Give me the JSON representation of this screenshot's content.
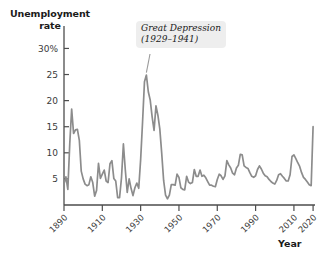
{
  "chart_data": {
    "type": "line",
    "title": "",
    "ylabel": "Unemployment rate",
    "xlabel": "Year",
    "ylim": [
      0,
      32
    ],
    "xlim": [
      1890,
      2021
    ],
    "grid": false,
    "legend": "none",
    "y_ticks": [
      {
        "value": 30,
        "label": "30%"
      },
      {
        "value": 25,
        "label": "25"
      },
      {
        "value": 20,
        "label": "20"
      },
      {
        "value": 15,
        "label": "15"
      },
      {
        "value": 10,
        "label": "10"
      },
      {
        "value": 5,
        "label": "5"
      }
    ],
    "x_ticks": [
      {
        "value": 1890,
        "label": "1890"
      },
      {
        "value": 1910,
        "label": "1910"
      },
      {
        "value": 1930,
        "label": "1930"
      },
      {
        "value": 1950,
        "label": "1950"
      },
      {
        "value": 1970,
        "label": "1970"
      },
      {
        "value": 1990,
        "label": "1990"
      },
      {
        "value": 2010,
        "label": "2010"
      },
      {
        "value": 2020,
        "label": "2020"
      }
    ],
    "series": [
      {
        "name": "Unemployment rate",
        "color": "#8c8c8c",
        "x": [
          1890,
          1891,
          1892,
          1893,
          1894,
          1895,
          1896,
          1897,
          1898,
          1899,
          1900,
          1901,
          1902,
          1903,
          1904,
          1905,
          1906,
          1907,
          1908,
          1909,
          1910,
          1911,
          1912,
          1913,
          1914,
          1915,
          1916,
          1917,
          1918,
          1919,
          1920,
          1921,
          1922,
          1923,
          1924,
          1925,
          1926,
          1927,
          1928,
          1929,
          1930,
          1931,
          1932,
          1933,
          1934,
          1935,
          1936,
          1937,
          1938,
          1939,
          1940,
          1941,
          1942,
          1943,
          1944,
          1945,
          1946,
          1947,
          1948,
          1949,
          1950,
          1951,
          1952,
          1953,
          1954,
          1955,
          1956,
          1957,
          1958,
          1959,
          1960,
          1961,
          1962,
          1963,
          1964,
          1965,
          1966,
          1967,
          1968,
          1969,
          1970,
          1971,
          1972,
          1973,
          1974,
          1975,
          1976,
          1977,
          1978,
          1979,
          1980,
          1981,
          1982,
          1983,
          1984,
          1985,
          1986,
          1987,
          1988,
          1989,
          1990,
          1991,
          1992,
          1993,
          1994,
          1995,
          1996,
          1997,
          1998,
          1999,
          2000,
          2001,
          2002,
          2003,
          2004,
          2005,
          2006,
          2007,
          2008,
          2009,
          2010,
          2011,
          2012,
          2013,
          2014,
          2015,
          2016,
          2017,
          2018,
          2019,
          2020
        ],
        "values": [
          4.0,
          5.4,
          3.0,
          11.7,
          18.4,
          13.7,
          14.4,
          14.5,
          12.4,
          6.5,
          5.0,
          4.0,
          3.7,
          3.9,
          5.4,
          4.3,
          1.7,
          2.8,
          8.0,
          5.1,
          5.9,
          6.7,
          4.6,
          4.3,
          7.9,
          8.5,
          5.1,
          4.6,
          1.4,
          1.4,
          5.2,
          11.7,
          6.7,
          2.4,
          5.0,
          3.2,
          1.8,
          3.3,
          4.2,
          3.2,
          8.7,
          15.9,
          23.6,
          24.9,
          21.7,
          20.1,
          16.9,
          14.3,
          19.0,
          17.2,
          14.6,
          9.9,
          4.7,
          1.9,
          1.2,
          1.9,
          3.9,
          3.9,
          3.8,
          5.9,
          5.3,
          3.3,
          3.0,
          2.9,
          5.5,
          4.4,
          4.1,
          4.3,
          6.8,
          5.5,
          5.5,
          6.7,
          5.5,
          5.7,
          5.2,
          4.5,
          3.8,
          3.8,
          3.6,
          3.5,
          4.9,
          5.9,
          5.6,
          4.9,
          5.6,
          8.5,
          7.7,
          7.1,
          6.1,
          5.8,
          7.1,
          7.6,
          9.7,
          9.6,
          7.5,
          7.2,
          7.0,
          6.2,
          5.5,
          5.3,
          5.6,
          6.8,
          7.5,
          6.9,
          6.1,
          5.6,
          5.4,
          4.9,
          4.5,
          4.2,
          4.0,
          4.7,
          5.8,
          6.0,
          5.5,
          5.1,
          4.6,
          4.6,
          5.8,
          9.3,
          9.6,
          8.9,
          8.1,
          7.4,
          6.2,
          5.3,
          4.9,
          4.4,
          3.9,
          3.7,
          15.0
        ]
      }
    ],
    "annotations": [
      {
        "id": "great-depression",
        "line1": "Great Depression",
        "line2": "(1929–1941)",
        "points_to_year": 1933,
        "points_to_value": 25
      }
    ]
  },
  "labels": {
    "y_axis_title_line1": "Unemployment",
    "y_axis_title_line2": "rate",
    "x_axis_title": "Year"
  },
  "colors": {
    "line": "#8c8c8c",
    "axis": "#4d4d4d",
    "text": "#1a1a1a",
    "annotation_background": "#eeeeee",
    "background": "#ffffff"
  }
}
